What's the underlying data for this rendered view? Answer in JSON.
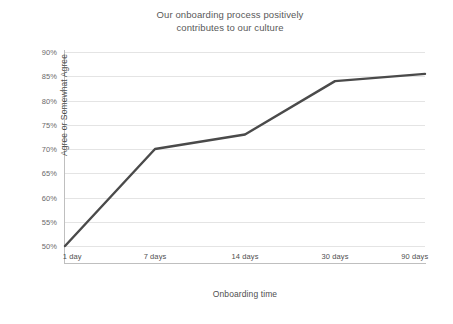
{
  "chart_data": {
    "type": "line",
    "title_line1": "Our onboarding process positively",
    "title_line2": "contributes to our culture",
    "xlabel": "Onboarding time",
    "ylabel": "Agree or Somewhat Agree",
    "categories": [
      "1 day",
      "7 days",
      "14 days",
      "30 days",
      "90 days"
    ],
    "values": [
      50,
      70,
      73,
      84,
      85.5
    ],
    "value_labels": [
      "50%",
      "70%",
      "73%",
      "84%",
      "85.5%"
    ],
    "series": [
      {
        "name": "Agree or Somewhat Agree",
        "values": [
          50,
          70,
          73,
          84,
          85.5
        ],
        "color": "#4a4a4a"
      }
    ],
    "ylim": [
      50,
      90
    ],
    "ytick_values": [
      50,
      55,
      60,
      65,
      70,
      75,
      80,
      85,
      90
    ],
    "ytick_labels": [
      "50%",
      "55%",
      "60%",
      "65%",
      "70%",
      "75%",
      "80%",
      "85%",
      "90%"
    ],
    "grid": "horizontal",
    "legend": "none",
    "background": "#ffffff",
    "gridline_color": "#e4e4e4",
    "axis_color": "#bfbfbf",
    "title_color": "#595959",
    "tick_color": "#6b6b6b",
    "label_color": "#4f4f4f"
  }
}
